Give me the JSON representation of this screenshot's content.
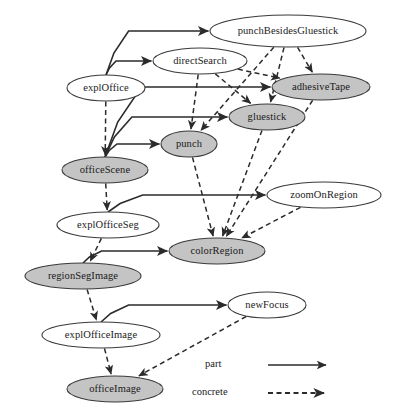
{
  "diagram": {
    "colors": {
      "shaded_node_fill": "#c4c4c4",
      "plain_node_fill": "#ffffff",
      "stroke": "#2b2b2b"
    },
    "nodes": [
      {
        "id": "punchBesidesGluestick",
        "label": "punchBesidesGluestick",
        "shaded": false,
        "cx": 288,
        "cy": 31,
        "rx": 78,
        "ry": 16
      },
      {
        "id": "directSearch",
        "label": "directSearch",
        "shaded": false,
        "cx": 200,
        "cy": 61,
        "rx": 47,
        "ry": 13
      },
      {
        "id": "explOffice",
        "label": "explOffice",
        "shaded": false,
        "cx": 106,
        "cy": 88,
        "rx": 39,
        "ry": 13
      },
      {
        "id": "adhesiveTape",
        "label": "adhesiveTape",
        "shaded": true,
        "cx": 321,
        "cy": 87,
        "rx": 49,
        "ry": 13
      },
      {
        "id": "gluestick",
        "label": "gluestick",
        "shaded": true,
        "cx": 267,
        "cy": 117,
        "rx": 38,
        "ry": 13
      },
      {
        "id": "punch",
        "label": "punch",
        "shaded": true,
        "cx": 189,
        "cy": 144,
        "rx": 28,
        "ry": 13
      },
      {
        "id": "officeScene",
        "label": "officeScene",
        "shaded": true,
        "cx": 105,
        "cy": 170,
        "rx": 43,
        "ry": 13
      },
      {
        "id": "zoomOnRegion",
        "label": "zoomOnRegion",
        "shaded": false,
        "cx": 324,
        "cy": 195,
        "rx": 57,
        "ry": 13
      },
      {
        "id": "explOfficeSeg",
        "label": "explOfficeSeg",
        "shaded": false,
        "cx": 108,
        "cy": 225,
        "rx": 51,
        "ry": 13
      },
      {
        "id": "colorRegion",
        "label": "colorRegion",
        "shaded": true,
        "cx": 217,
        "cy": 251,
        "rx": 48,
        "ry": 13
      },
      {
        "id": "regionSegImage",
        "label": "regionSegImage",
        "shaded": true,
        "cx": 83,
        "cy": 276,
        "rx": 58,
        "ry": 13
      },
      {
        "id": "newFocus",
        "label": "newFocus",
        "shaded": false,
        "cx": 267,
        "cy": 305,
        "rx": 39,
        "ry": 13
      },
      {
        "id": "explOfficeImage",
        "label": "explOfficeImage",
        "shaded": false,
        "cx": 101,
        "cy": 335,
        "rx": 59,
        "ry": 13
      },
      {
        "id": "officeImage",
        "label": "officeImage",
        "shaded": true,
        "cx": 115,
        "cy": 389,
        "rx": 48,
        "ry": 13
      }
    ],
    "edges": [
      {
        "from": "explOffice",
        "to": "punchBesidesGluestick",
        "type": "part"
      },
      {
        "from": "explOffice",
        "to": "directSearch",
        "type": "part"
      },
      {
        "from": "officeScene",
        "to": "adhesiveTape",
        "type": "part"
      },
      {
        "from": "officeScene",
        "to": "gluestick",
        "type": "part"
      },
      {
        "from": "officeScene",
        "to": "punch",
        "type": "part"
      },
      {
        "from": "explOfficeSeg",
        "to": "zoomOnRegion",
        "type": "part"
      },
      {
        "from": "regionSegImage",
        "to": "colorRegion",
        "type": "part"
      },
      {
        "from": "explOfficeImage",
        "to": "newFocus",
        "type": "part"
      },
      {
        "from": "explOffice",
        "to": "officeScene",
        "type": "concrete"
      },
      {
        "from": "directSearch",
        "to": "punch",
        "type": "concrete"
      },
      {
        "from": "directSearch",
        "to": "gluestick",
        "type": "concrete"
      },
      {
        "from": "directSearch",
        "to": "adhesiveTape",
        "type": "concrete"
      },
      {
        "from": "punchBesidesGluestick",
        "to": "punch",
        "type": "concrete"
      },
      {
        "from": "punchBesidesGluestick",
        "to": "gluestick",
        "type": "concrete"
      },
      {
        "from": "punchBesidesGluestick",
        "to": "adhesiveTape",
        "type": "concrete"
      },
      {
        "from": "punch",
        "to": "colorRegion",
        "type": "concrete"
      },
      {
        "from": "gluestick",
        "to": "colorRegion",
        "type": "concrete"
      },
      {
        "from": "adhesiveTape",
        "to": "colorRegion",
        "type": "concrete"
      },
      {
        "from": "zoomOnRegion",
        "to": "colorRegion",
        "type": "concrete"
      },
      {
        "from": "officeScene",
        "to": "explOfficeSeg",
        "type": "concrete"
      },
      {
        "from": "explOfficeSeg",
        "to": "regionSegImage",
        "type": "concrete"
      },
      {
        "from": "regionSegImage",
        "to": "explOfficeImage",
        "type": "concrete"
      },
      {
        "from": "explOfficeImage",
        "to": "officeImage",
        "type": "concrete"
      },
      {
        "from": "newFocus",
        "to": "officeImage",
        "type": "concrete"
      }
    ],
    "legend": {
      "items": [
        {
          "label": "part",
          "style": "solid-arrow"
        },
        {
          "label": "concrete",
          "style": "dashed-arrow"
        }
      ]
    }
  }
}
